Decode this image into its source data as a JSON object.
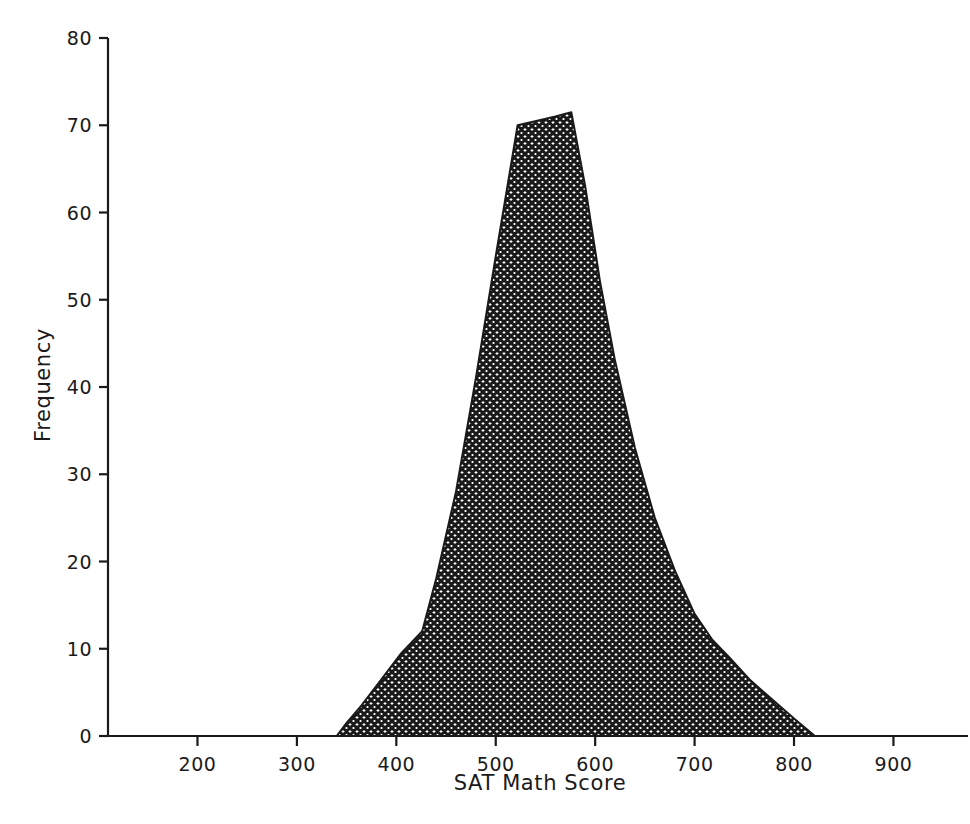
{
  "chart_data": {
    "type": "area",
    "title": "",
    "subtitle": "",
    "xlabel": "SAT Math Score",
    "ylabel": "Frequency",
    "xlim": [
      110,
      975
    ],
    "ylim": [
      0,
      80
    ],
    "xticks": [
      200,
      300,
      400,
      500,
      600,
      700,
      800,
      900
    ],
    "xticklabels": [
      "200",
      "300",
      "400",
      "500",
      "600",
      "700",
      "800",
      "900"
    ],
    "yticks": [
      0,
      10,
      20,
      30,
      40,
      50,
      60,
      70,
      80
    ],
    "yticklabels": [
      "0",
      "10",
      "20",
      "30",
      "40",
      "50",
      "60",
      "70",
      "80"
    ],
    "grid": false,
    "legend": null,
    "fill_style": "crosshatch",
    "fill_color": "#1a1a1a",
    "line_color": "#1a1a1a",
    "annotations": [],
    "x": [
      340,
      350,
      365,
      385,
      405,
      426,
      440,
      460,
      480,
      500,
      522,
      545,
      560,
      576,
      590,
      605,
      620,
      640,
      660,
      680,
      700,
      718,
      735,
      755,
      775,
      800,
      821
    ],
    "values": [
      0,
      1.5,
      3.5,
      6.5,
      9.5,
      12,
      18,
      28,
      41,
      55,
      70,
      70.6,
      71.0,
      71.5,
      63,
      52,
      43,
      33,
      25,
      19,
      14,
      11,
      9,
      6.5,
      4.5,
      2.0,
      0
    ],
    "series": [
      {
        "name": "SAT Math Score distribution",
        "values": [
          0,
          1.5,
          3.5,
          6.5,
          9.5,
          12,
          18,
          28,
          41,
          55,
          70,
          70.6,
          71.0,
          71.5,
          63,
          52,
          43,
          33,
          25,
          19,
          14,
          11,
          9,
          6.5,
          4.5,
          2.0,
          0
        ]
      }
    ],
    "peak": {
      "x": 576,
      "y": 71.5
    },
    "left_zero": 340,
    "right_zero": 821
  },
  "axes": {
    "x_title": "SAT Math Score",
    "y_title": "Frequency"
  }
}
